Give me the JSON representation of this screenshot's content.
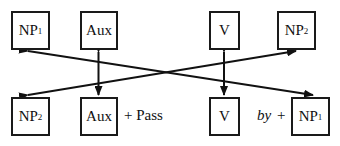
{
  "diagram": {
    "top_row": [
      {
        "id": "np1",
        "text": "NP",
        "sub": "1"
      },
      {
        "id": "aux",
        "text": "Aux",
        "sub": ""
      },
      {
        "id": "v",
        "text": "V",
        "sub": ""
      },
      {
        "id": "np2",
        "text": "NP",
        "sub": "2"
      }
    ],
    "bottom_row": [
      {
        "id": "np2",
        "text": "NP",
        "sub": "2"
      },
      {
        "id": "aux",
        "text": "Aux",
        "sub": ""
      },
      {
        "id": "v",
        "text": "V",
        "sub": ""
      },
      {
        "id": "np1",
        "text": "NP",
        "sub": "1"
      }
    ],
    "annotations": {
      "pass": "+ Pass",
      "by": "by",
      "by_plus": "+"
    },
    "arrows": [
      {
        "from": "top.np2",
        "to": "bottom.np2",
        "note": "crossing diagonal"
      },
      {
        "from": "top.np1",
        "to": "bottom.np1",
        "note": "crossing diagonal"
      },
      {
        "from": "top.aux",
        "to": "bottom.aux",
        "note": "vertical double-headed"
      },
      {
        "from": "top.v",
        "to": "bottom.v",
        "note": "vertical double-headed"
      }
    ]
  }
}
